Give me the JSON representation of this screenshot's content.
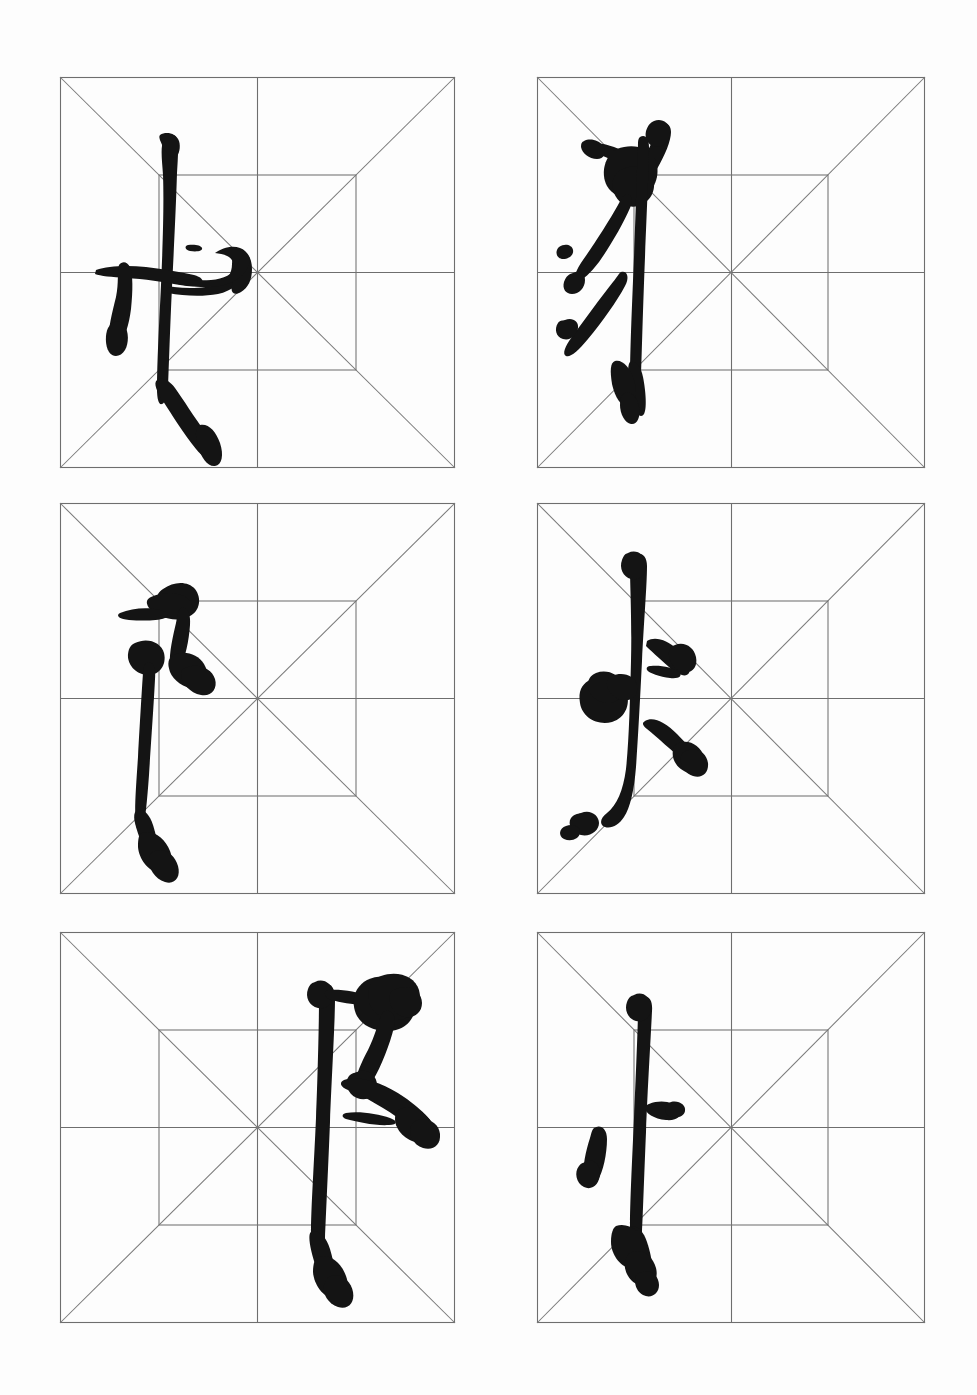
{
  "page": {
    "kind": "calligraphy-practice-sheet",
    "background_color": "#fdfdfd",
    "width": 977,
    "height": 1395
  },
  "grid_style": {
    "border_color": "#6e6e6e",
    "diagonal_color": "#7a7a7a",
    "midline_color": "#6e6e6e",
    "inner_square_color": "#707070",
    "line_width": 1.1,
    "inner_square_inset_pct": 25
  },
  "ink": {
    "color": "#141414",
    "medium": "brush-ink"
  },
  "layout": {
    "columns": 2,
    "rows": 3,
    "cell_width": 395,
    "cell_height": 391,
    "col_x": [
      60,
      537
    ],
    "row_y": [
      77,
      503,
      932
    ]
  },
  "cells": [
    {
      "id": "cell-r1c1",
      "row": 1,
      "column": 1,
      "character": "扌",
      "romanization": "ti shou pang",
      "meaning": "hand radical",
      "stroke_count": 3,
      "x": 60,
      "y": 77,
      "w": 395,
      "h": 391
    },
    {
      "id": "cell-r1c2",
      "row": 1,
      "column": 2,
      "character": "禾",
      "romanization": "he",
      "meaning": "grain radical",
      "stroke_count": 5,
      "x": 537,
      "y": 77,
      "w": 388,
      "h": 391
    },
    {
      "id": "cell-r2c1",
      "row": 2,
      "column": 1,
      "character": "阝",
      "romanization": "zuo er dao",
      "meaning": "left ear radical",
      "stroke_count": 2,
      "x": 60,
      "y": 503,
      "w": 395,
      "h": 391
    },
    {
      "id": "cell-r2c2",
      "row": 2,
      "column": 2,
      "character": "火",
      "romanization": "huo",
      "meaning": "fire radical",
      "stroke_count": 4,
      "x": 537,
      "y": 503,
      "w": 388,
      "h": 391
    },
    {
      "id": "cell-r3c1",
      "row": 3,
      "column": 1,
      "character": "阝",
      "romanization": "you er dao",
      "meaning": "right ear radical",
      "stroke_count": 2,
      "x": 60,
      "y": 932,
      "w": 395,
      "h": 391
    },
    {
      "id": "cell-r3c2",
      "row": 3,
      "column": 2,
      "character": "忄",
      "romanization": "shu xin pang",
      "meaning": "vertical heart radical",
      "stroke_count": 3,
      "x": 537,
      "y": 932,
      "w": 388,
      "h": 391
    }
  ]
}
